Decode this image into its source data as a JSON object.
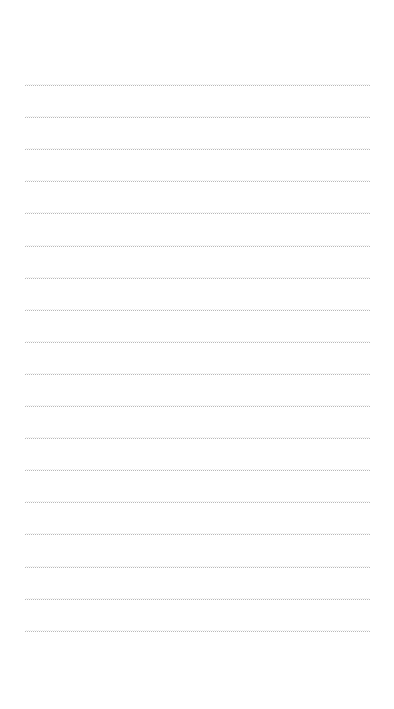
{
  "note": {
    "content": "",
    "background_color": "#ffffff",
    "line_color": "#b8b8b8",
    "line_style": "dotted",
    "line_count": 18,
    "first_line_y": 84,
    "line_spacing": 32.1,
    "line_left": 25,
    "line_width": 345
  }
}
